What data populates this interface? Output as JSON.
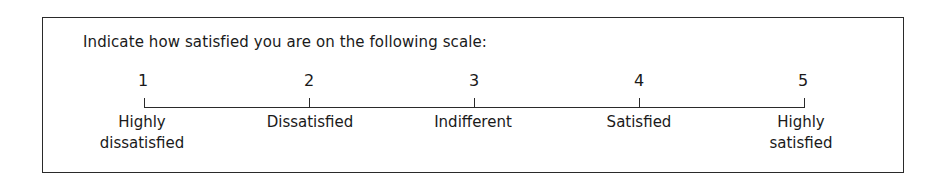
{
  "prompt": "Indicate how satisfied you are on the following scale:",
  "scale": [
    {
      "value": "1",
      "label_line1": "Highly",
      "label_line2": "dissatisfied"
    },
    {
      "value": "2",
      "label_line1": "Dissatisfied",
      "label_line2": ""
    },
    {
      "value": "3",
      "label_line1": "Indifferent",
      "label_line2": ""
    },
    {
      "value": "4",
      "label_line1": "Satisfied",
      "label_line2": ""
    },
    {
      "value": "5",
      "label_line1": "Highly",
      "label_line2": "satisfied"
    }
  ]
}
